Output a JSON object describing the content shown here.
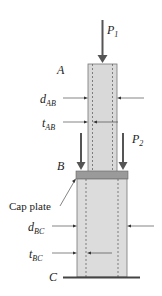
{
  "diagram": {
    "type": "two-segment hollow tube column with cap plate",
    "labels": {
      "point_a": "A",
      "point_b": "B",
      "point_c": "C",
      "load_1": {
        "main": "P",
        "sub": "1"
      },
      "load_2": {
        "main": "P",
        "sub": "2"
      },
      "d_ab": {
        "main": "d",
        "sub": "AB"
      },
      "t_ab": {
        "main": "t",
        "sub": "AB"
      },
      "d_bc": {
        "main": "d",
        "sub": "BC"
      },
      "t_bc": {
        "main": "t",
        "sub": "BC"
      },
      "cap_plate": "Cap plate"
    },
    "colors": {
      "tube_fill": "#d9d9d9",
      "cap_plate_fill": "#9a9a9a",
      "load_arrow": "#555555",
      "dim_line": "#333333",
      "ground": "#444444"
    }
  }
}
